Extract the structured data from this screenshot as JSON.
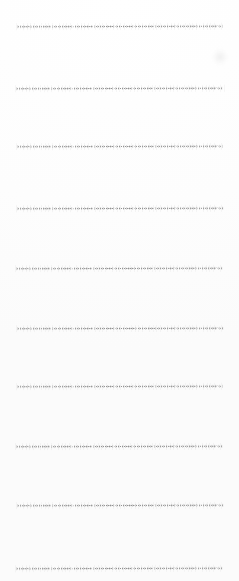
{
  "document": {
    "kind": "ruled-paper-scan",
    "title": "Blank ruled notebook paper",
    "page_width": 239,
    "page_height": 581,
    "background_color": "#fefefe",
    "written_text": "",
    "has_margin_rule": false,
    "has_header": false
  },
  "ruling": {
    "line_count": 10,
    "line_color": "#8d8d8d",
    "line_thickness": 1.5,
    "line_style": "dotted-stipple",
    "line_left_x": 18,
    "line_right_x": 223,
    "average_spacing": 60,
    "lines": [
      {
        "index": 1,
        "y": 26,
        "left": 18,
        "right": 222,
        "tilt": -0.12,
        "opacity": 0.92
      },
      {
        "index": 2,
        "y": 88,
        "left": 17,
        "right": 223,
        "tilt": -0.1,
        "opacity": 0.95
      },
      {
        "index": 3,
        "y": 146,
        "left": 18,
        "right": 222,
        "tilt": -0.08,
        "opacity": 0.93
      },
      {
        "index": 4,
        "y": 208,
        "left": 18,
        "right": 223,
        "tilt": -0.11,
        "opacity": 0.96
      },
      {
        "index": 5,
        "y": 268,
        "left": 17,
        "right": 222,
        "tilt": -0.09,
        "opacity": 0.94
      },
      {
        "index": 6,
        "y": 328,
        "left": 18,
        "right": 223,
        "tilt": -0.07,
        "opacity": 0.95
      },
      {
        "index": 7,
        "y": 386,
        "left": 18,
        "right": 222,
        "tilt": -0.1,
        "opacity": 0.93
      },
      {
        "index": 8,
        "y": 446,
        "left": 17,
        "right": 222,
        "tilt": -0.08,
        "opacity": 0.96
      },
      {
        "index": 9,
        "y": 505,
        "left": 18,
        "right": 223,
        "tilt": -0.09,
        "opacity": 0.94
      },
      {
        "index": 10,
        "y": 568,
        "left": 17,
        "right": 222,
        "tilt": -0.11,
        "opacity": 0.95
      }
    ]
  },
  "artifacts": [
    {
      "name": "scanner-smudge",
      "x": 212,
      "y": 48,
      "width": 16,
      "height": 18
    }
  ]
}
